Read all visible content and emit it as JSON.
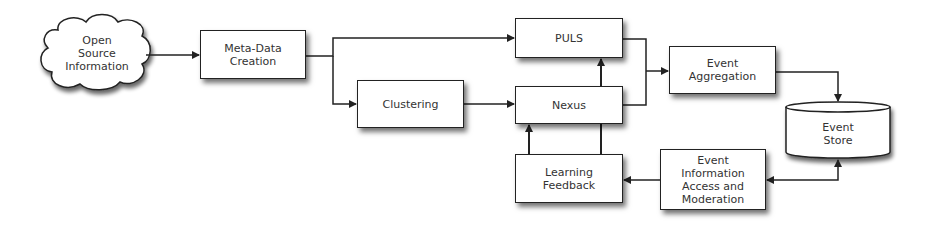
{
  "diagram": {
    "nodes": {
      "open_source": {
        "label": "Open\nSource\nInformation",
        "shape": "cloud"
      },
      "meta_data": {
        "label": "Meta-Data\nCreation",
        "shape": "box"
      },
      "clustering": {
        "label": "Clustering",
        "shape": "box"
      },
      "puls": {
        "label": "PULS",
        "shape": "box"
      },
      "nexus": {
        "label": "Nexus",
        "shape": "box"
      },
      "learning_feedback": {
        "label": "Learning\nFeedback",
        "shape": "box"
      },
      "event_aggregation": {
        "label": "Event\nAggregation",
        "shape": "box"
      },
      "event_store": {
        "label": "Event\nStore",
        "shape": "cylinder"
      },
      "event_info_access": {
        "label": "Event\nInformation\nAccess and\nModeration",
        "shape": "box"
      }
    },
    "edges": [
      {
        "from": "Open Source Information",
        "to": "Meta-Data Creation"
      },
      {
        "from": "Meta-Data Creation",
        "to": "PULS"
      },
      {
        "from": "Meta-Data Creation",
        "to": "Clustering"
      },
      {
        "from": "Clustering",
        "to": "Nexus"
      },
      {
        "from": "PULS",
        "to": "Event Aggregation"
      },
      {
        "from": "Nexus",
        "to": "Event Aggregation"
      },
      {
        "from": "Event Aggregation",
        "to": "Event Store"
      },
      {
        "from": "Event Store",
        "to": "Event Information Access and Moderation",
        "bidirectional": true
      },
      {
        "from": "Event Information Access and Moderation",
        "to": "Learning Feedback"
      },
      {
        "from": "Learning Feedback",
        "to": "Nexus"
      },
      {
        "from": "Learning Feedback",
        "to": "PULS"
      }
    ],
    "colors": {
      "stroke": "#222222",
      "fill": "#ffffff",
      "text": "#333333"
    }
  }
}
